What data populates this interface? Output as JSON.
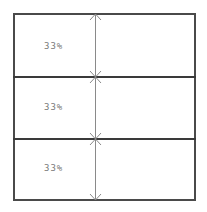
{
  "diagram": {
    "type": "stacked-proportion-boxes",
    "rows": [
      {
        "label": "33%"
      },
      {
        "label": "33%"
      },
      {
        "label": "33%"
      }
    ],
    "colors": {
      "border": "#4a4a4a",
      "arrow": "#8a8a8a",
      "text": "#7a7a7a"
    }
  }
}
